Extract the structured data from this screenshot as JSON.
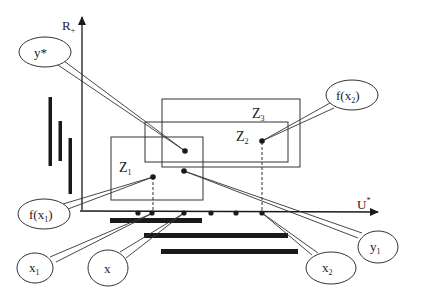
{
  "colors": {
    "ink": "#1a1a1a",
    "line": "#333333",
    "background": "#ffffff"
  },
  "axes": {
    "vertical": {
      "label": "R",
      "label_sub": "+"
    },
    "horizontal": {
      "label": "U",
      "label_sup": "*"
    }
  },
  "zones": [
    {
      "id": "Z1",
      "label": "Z",
      "sub": "1"
    },
    {
      "id": "Z2",
      "label": "Z",
      "sub": "2"
    },
    {
      "id": "Z3",
      "label": "Z",
      "sub": "3"
    }
  ],
  "callouts": {
    "y_star": {
      "label": "y*"
    },
    "f_x2": {
      "label": "f(x",
      "sub": "2",
      "suffix": ")"
    },
    "f_x1": {
      "label": "f(x",
      "sub": "1",
      "suffix": ")"
    },
    "x1": {
      "label": "x",
      "sub": "1"
    },
    "x": {
      "label": "x"
    },
    "x2": {
      "label": "x",
      "sub": "2"
    },
    "y1": {
      "label": "y",
      "sub": "1"
    }
  },
  "axis_points_count": 6,
  "vertical_bars_count": 3,
  "horizontal_bars_count": 3
}
